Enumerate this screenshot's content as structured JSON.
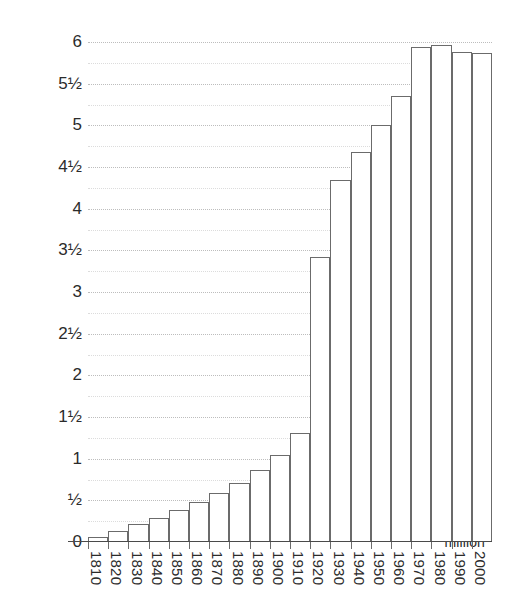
{
  "chart_data": {
    "type": "bar",
    "title": "",
    "xlabel": "",
    "ylabel": "million",
    "categories": [
      "1810",
      "1820",
      "1830",
      "1840",
      "1850",
      "1860",
      "1870",
      "1880",
      "1890",
      "1900",
      "1910",
      "1920",
      "1930",
      "1940",
      "1950",
      "1960",
      "1970",
      "1980",
      "1990",
      "2000"
    ],
    "values": [
      0.06,
      0.13,
      0.22,
      0.29,
      0.38,
      0.48,
      0.59,
      0.71,
      0.86,
      1.04,
      1.31,
      3.42,
      4.34,
      4.68,
      5.0,
      5.35,
      5.94,
      5.96,
      5.88,
      5.87
    ],
    "ylim": [
      0,
      6
    ],
    "ytick_values": [
      0,
      0.5,
      1,
      1.5,
      2,
      2.5,
      3,
      3.5,
      4,
      4.5,
      5,
      5.5,
      6
    ],
    "ytick_labels": [
      "0",
      "½",
      "1",
      "1½",
      "2",
      "2½",
      "3",
      "3½",
      "4",
      "4½",
      "5",
      "5½",
      "6"
    ],
    "minor_gridline_values": [
      0.25,
      0.75,
      1.25,
      1.75,
      2.25,
      2.75,
      3.25,
      3.75,
      4.25,
      4.75,
      5.25,
      5.75
    ],
    "grid": true,
    "grid_style": "dotted",
    "legend": "none",
    "bar_fill": "#ffffff",
    "bar_stroke": "#6b6b6b",
    "axis_color": "#4a4a4a",
    "grid_color": "#c8c8c8",
    "text_color": "#2b2b2b",
    "background": "#ffffff"
  }
}
